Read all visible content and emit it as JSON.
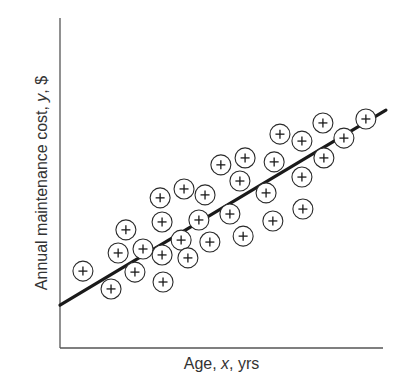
{
  "chart_data": {
    "type": "scatter",
    "title": "",
    "xlabel": "Age, x, yrs",
    "ylabel": "Annual maintenance cost, y, $",
    "xlabel_parts": [
      "Age, ",
      "x",
      ", yrs"
    ],
    "ylabel_parts": [
      "Annual maintenance cost, ",
      "y",
      ", $"
    ],
    "xlim": [
      0,
      100
    ],
    "ylim": [
      0,
      100
    ],
    "ticks": false,
    "grid": false,
    "legend": null,
    "marker": "circled-plus",
    "points": [
      {
        "x": 7.1,
        "y": 23.3
      },
      {
        "x": 15.8,
        "y": 17.9
      },
      {
        "x": 18.0,
        "y": 28.8
      },
      {
        "x": 20.4,
        "y": 35.8
      },
      {
        "x": 23.2,
        "y": 23.0
      },
      {
        "x": 25.7,
        "y": 30.0
      },
      {
        "x": 31.0,
        "y": 45.5
      },
      {
        "x": 31.6,
        "y": 38.2
      },
      {
        "x": 31.6,
        "y": 28.2
      },
      {
        "x": 31.9,
        "y": 20.0
      },
      {
        "x": 37.5,
        "y": 32.7
      },
      {
        "x": 38.4,
        "y": 48.2
      },
      {
        "x": 39.6,
        "y": 27.3
      },
      {
        "x": 43.0,
        "y": 38.8
      },
      {
        "x": 44.9,
        "y": 46.4
      },
      {
        "x": 46.4,
        "y": 32.1
      },
      {
        "x": 49.8,
        "y": 55.5
      },
      {
        "x": 52.6,
        "y": 40.6
      },
      {
        "x": 55.7,
        "y": 50.6
      },
      {
        "x": 56.7,
        "y": 33.9
      },
      {
        "x": 57.3,
        "y": 57.6
      },
      {
        "x": 63.8,
        "y": 47.0
      },
      {
        "x": 65.9,
        "y": 38.5
      },
      {
        "x": 66.3,
        "y": 56.4
      },
      {
        "x": 68.1,
        "y": 64.8
      },
      {
        "x": 74.9,
        "y": 62.7
      },
      {
        "x": 74.9,
        "y": 51.8
      },
      {
        "x": 75.2,
        "y": 42.1
      },
      {
        "x": 81.4,
        "y": 68.2
      },
      {
        "x": 81.7,
        "y": 57.6
      },
      {
        "x": 87.9,
        "y": 63.6
      },
      {
        "x": 94.7,
        "y": 69.4
      }
    ],
    "regression_line": {
      "x": [
        0,
        100.9
      ],
      "y": [
        13.0,
        72.1
      ]
    }
  },
  "layout": {
    "plot_left": 60,
    "plot_right": 383,
    "plot_top": 18,
    "plot_bottom": 348,
    "marker_radius": 10,
    "marker_plus_half": 4.5
  }
}
